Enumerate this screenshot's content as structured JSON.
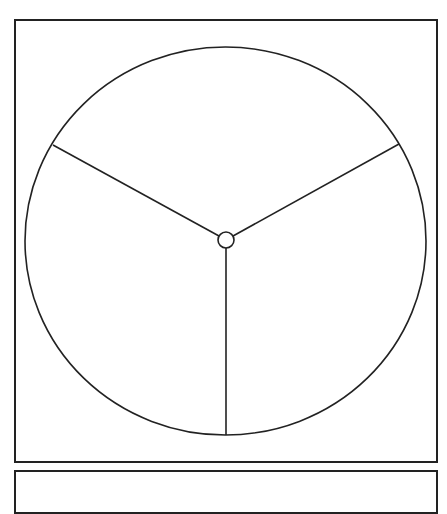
{
  "diagram": {
    "type": "circle-divided-into-thirds",
    "sections": 3,
    "labels": [],
    "colors": {
      "stroke": "#222222",
      "fill": "#ffffff",
      "background": "#ffffff"
    },
    "outer_circle": {
      "cx": 225.5,
      "cy": 241,
      "rx": 200.5,
      "ry": 194
    },
    "hub": {
      "cx": 226,
      "cy": 240,
      "r": 8
    },
    "spokes": [
      {
        "name": "upper-left",
        "x1": 219,
        "y1": 236,
        "x2": 53,
        "y2": 145
      },
      {
        "name": "upper-right",
        "x1": 233,
        "y1": 236,
        "x2": 399,
        "y2": 144
      },
      {
        "name": "bottom",
        "x1": 226,
        "y1": 248,
        "x2": 226,
        "y2": 435
      }
    ]
  }
}
